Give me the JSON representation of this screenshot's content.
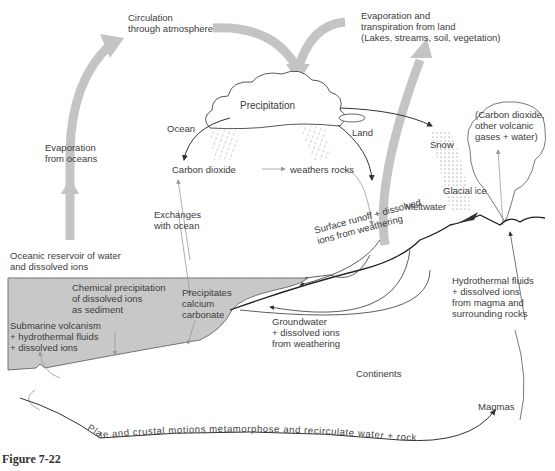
{
  "figure": {
    "caption": "Figure 7-22",
    "colors": {
      "ocean_fill": "#c8c8c8",
      "flow_arrow": "#c4c4c4",
      "line": "#333333",
      "light_line": "#999999"
    }
  },
  "labels": {
    "circulation": "Circulation\nthrough atmosphere",
    "evap_land": "Evaporation and\ntranspiration from land\n(Lakes, streams, soil, vegetation)",
    "precipitation": "Precipitation",
    "ocean": "Ocean",
    "land": "Land",
    "snow": "Snow",
    "volcanic_gases": "(Carbon dioxide,\nother volcanic\ngases + water)",
    "evap_oceans": "Evaporation\nfrom oceans",
    "carbon_dioxide": "Carbon dioxide",
    "weathers_rocks": "weathers rocks",
    "glacial_ice": "Glacial ice",
    "meltwater": "Meltwater",
    "exchanges": "Exchanges\nwith ocean",
    "oceanic_reservoir": "Oceanic reservoir of water\nand dissolved ions",
    "surface_runoff": "Surface runoff + dissolved\nions from weathering",
    "chem_precip": "Chemical precipitation\nof dissolved ions\nas sediment",
    "precip_caco3": "Precipitates\ncalcium\ncarbonate",
    "hydrothermal": "Hydrothermal fluids\n+ dissolved ions\nfrom magma and\nsurrounding rocks",
    "submarine": "Submarine volcanism\n+ hydrothermal fluids\n+ dissolved ions",
    "groundwater": "Groundwater\n+ dissolved ions\nfrom weathering",
    "continents": "Continents",
    "magmas": "Magmas",
    "plate_motions": "Plate and crustal motions metamorphose and recirculate water + rock"
  }
}
